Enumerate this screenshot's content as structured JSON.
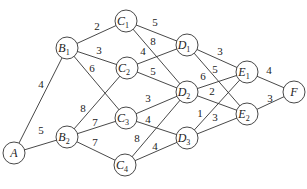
{
  "nodes": [
    {
      "id": "A",
      "name": "A",
      "sub": "",
      "x": 14,
      "y": 153
    },
    {
      "id": "B1",
      "name": "B",
      "sub": "1",
      "x": 67,
      "y": 48
    },
    {
      "id": "B2",
      "name": "B",
      "sub": "2",
      "x": 67,
      "y": 137
    },
    {
      "id": "C1",
      "name": "C",
      "sub": "1",
      "x": 126,
      "y": 21
    },
    {
      "id": "C2",
      "name": "C",
      "sub": "2",
      "x": 127,
      "y": 68
    },
    {
      "id": "C3",
      "name": "C",
      "sub": "3",
      "x": 126,
      "y": 118
    },
    {
      "id": "C4",
      "name": "C",
      "sub": "4",
      "x": 125,
      "y": 165
    },
    {
      "id": "D1",
      "name": "D",
      "sub": "1",
      "x": 187,
      "y": 45
    },
    {
      "id": "D2",
      "name": "D",
      "sub": "2",
      "x": 187,
      "y": 92
    },
    {
      "id": "D3",
      "name": "D",
      "sub": "3",
      "x": 187,
      "y": 138
    },
    {
      "id": "E1",
      "name": "E",
      "sub": "1",
      "x": 247,
      "y": 72
    },
    {
      "id": "E2",
      "name": "E",
      "sub": "2",
      "x": 247,
      "y": 114
    },
    {
      "id": "F",
      "name": "F",
      "sub": "",
      "x": 294,
      "y": 92
    }
  ],
  "edges": [
    {
      "from": "A",
      "to": "B1",
      "w": "4",
      "lx": 41,
      "ly": 88
    },
    {
      "from": "A",
      "to": "B2",
      "w": "5",
      "lx": 41,
      "ly": 134
    },
    {
      "from": "B1",
      "to": "C1",
      "w": "2",
      "lx": 97,
      "ly": 30
    },
    {
      "from": "B1",
      "to": "C2",
      "w": "3",
      "lx": 99,
      "ly": 54
    },
    {
      "from": "B1",
      "to": "C3",
      "w": "6",
      "lx": 92,
      "ly": 72
    },
    {
      "from": "B2",
      "to": "C2",
      "w": "8",
      "lx": 83,
      "ly": 112
    },
    {
      "from": "B2",
      "to": "C3",
      "w": "7",
      "lx": 95,
      "ly": 126
    },
    {
      "from": "B2",
      "to": "C4",
      "w": "7",
      "lx": 95,
      "ly": 146
    },
    {
      "from": "C1",
      "to": "D1",
      "w": "5",
      "lx": 155,
      "ly": 26
    },
    {
      "from": "C1",
      "to": "D2",
      "w": "8",
      "lx": 153,
      "ly": 45
    },
    {
      "from": "C2",
      "to": "D1",
      "w": "4",
      "lx": 143,
      "ly": 55
    },
    {
      "from": "C2",
      "to": "D2",
      "w": "5",
      "lx": 153,
      "ly": 75
    },
    {
      "from": "C3",
      "to": "D2",
      "w": "3",
      "lx": 148,
      "ly": 102
    },
    {
      "from": "C3",
      "to": "D3",
      "w": "4",
      "lx": 148,
      "ly": 123
    },
    {
      "from": "C4",
      "to": "D2",
      "w": "8",
      "lx": 137,
      "ly": 142
    },
    {
      "from": "C4",
      "to": "D3",
      "w": "4",
      "lx": 155,
      "ly": 150
    },
    {
      "from": "D1",
      "to": "E1",
      "w": "3",
      "lx": 220,
      "ly": 55
    },
    {
      "from": "D1",
      "to": "E2",
      "w": "5",
      "lx": 215,
      "ly": 73
    },
    {
      "from": "D2",
      "to": "E1",
      "w": "6",
      "lx": 203,
      "ly": 80
    },
    {
      "from": "D2",
      "to": "E2",
      "w": "2",
      "lx": 212,
      "ly": 95
    },
    {
      "from": "D3",
      "to": "E1",
      "w": "1",
      "lx": 200,
      "ly": 117
    },
    {
      "from": "D3",
      "to": "E2",
      "w": "3",
      "lx": 215,
      "ly": 121
    },
    {
      "from": "E1",
      "to": "F",
      "w": "4",
      "lx": 269,
      "ly": 74
    },
    {
      "from": "E2",
      "to": "F",
      "w": "3",
      "lx": 270,
      "ly": 102
    }
  ],
  "style": {
    "line_color": "#333333",
    "background": "#ffffff"
  }
}
